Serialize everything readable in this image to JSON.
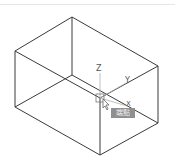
{
  "viewport": {
    "axes": {
      "z_label": "Z",
      "y_label": "Y",
      "x_label": "X"
    },
    "tooltip": {
      "text": "端點"
    },
    "colors": {
      "edge": "#3a3a3a",
      "axis": "#9a9a9a",
      "tooltip_bg": "#8f8f8f"
    }
  }
}
